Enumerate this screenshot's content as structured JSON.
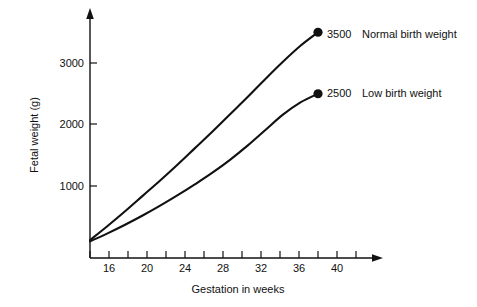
{
  "chart_data": {
    "type": "line",
    "title": "",
    "subtitle": "",
    "xlabel": "Gestation in weeks",
    "ylabel": "Fetal weight (g)",
    "xlim": [
      14,
      46
    ],
    "ylim": [
      0,
      3700
    ],
    "grid": false,
    "legend_position": "inline-right-of-endpoint",
    "x_ticks_major": [
      16,
      20,
      24,
      28,
      32,
      36,
      40
    ],
    "x_ticks_minor": [
      14,
      18,
      22,
      26,
      30,
      34,
      38,
      42,
      44,
      46
    ],
    "x_tick_labels": [
      "16",
      "20",
      "24",
      "28",
      "32",
      "36",
      "40"
    ],
    "y_ticks": [
      1000,
      2000,
      3000
    ],
    "y_tick_labels": [
      "1000",
      "2000",
      "3000"
    ],
    "series": [
      {
        "name": "Normal birth weight",
        "endpoint_label": "3500",
        "endpoint_x": 40,
        "endpoint_y": 3500,
        "x": [
          14,
          16,
          18,
          20,
          22,
          24,
          26,
          28,
          30,
          32,
          34,
          36,
          38,
          40
        ],
        "values": [
          120,
          350,
          590,
          840,
          1090,
          1350,
          1620,
          1890,
          2170,
          2450,
          2740,
          3020,
          3280,
          3500
        ]
      },
      {
        "name": "Low birth weight",
        "endpoint_label": "2500",
        "endpoint_x": 40,
        "endpoint_y": 2500,
        "x": [
          14,
          16,
          18,
          20,
          22,
          24,
          26,
          28,
          30,
          32,
          34,
          36,
          38,
          40
        ],
        "values": [
          100,
          230,
          370,
          520,
          680,
          850,
          1030,
          1220,
          1430,
          1660,
          1910,
          2160,
          2360,
          2500
        ]
      }
    ],
    "annotations": [
      {
        "value": "3500",
        "caption": "Normal birth weight"
      },
      {
        "value": "2500",
        "caption": "Low birth weight"
      }
    ],
    "colors": {
      "line": "#111111",
      "marker": "#111111",
      "axis": "#111111",
      "background": "#ffffff"
    }
  }
}
